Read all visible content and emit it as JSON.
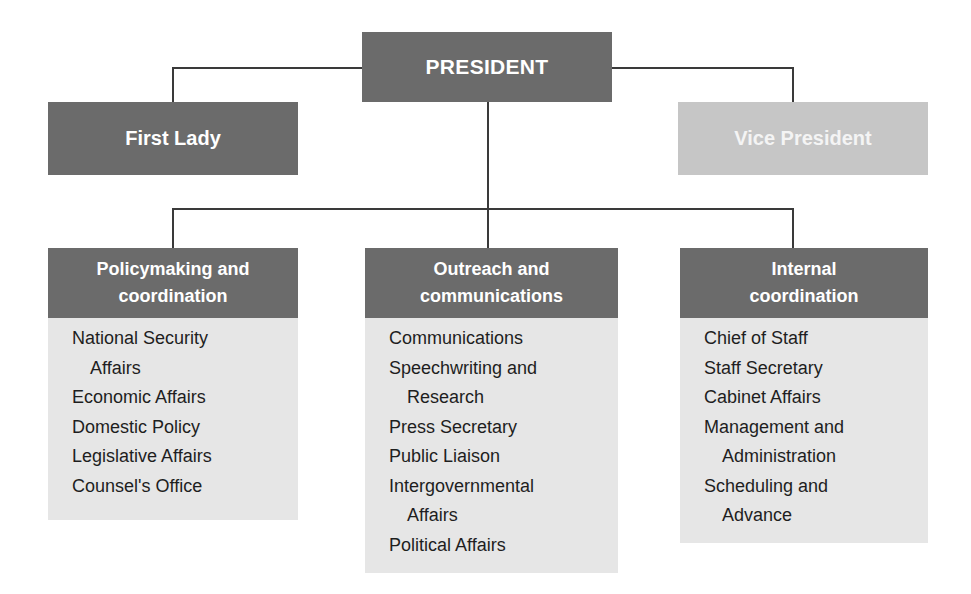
{
  "top": {
    "president": "PRESIDENT",
    "first_lady": "First Lady",
    "vice_president": "Vice President"
  },
  "units": [
    {
      "title_line1": "Policymaking and",
      "title_line2": "coordination",
      "items": [
        {
          "line1": "National Security",
          "line2": "Affairs"
        },
        {
          "line1": "Economic Affairs"
        },
        {
          "line1": "Domestic Policy"
        },
        {
          "line1": "Legislative Affairs"
        },
        {
          "line1": "Counsel's Office"
        }
      ]
    },
    {
      "title_line1": "Outreach and",
      "title_line2": "communications",
      "items": [
        {
          "line1": "Communications"
        },
        {
          "line1": "Speechwriting and",
          "line2": "Research"
        },
        {
          "line1": "Press Secretary"
        },
        {
          "line1": "Public Liaison"
        },
        {
          "line1": "Intergovernmental",
          "line2": "Affairs"
        },
        {
          "line1": "Political Affairs"
        }
      ]
    },
    {
      "title_line1": "Internal",
      "title_line2": "coordination",
      "items": [
        {
          "line1": "Chief of Staff"
        },
        {
          "line1": "Staff Secretary"
        },
        {
          "line1": "Cabinet Affairs"
        },
        {
          "line1": "Management and",
          "line2": "Administration"
        },
        {
          "line1": "Scheduling and",
          "line2": "Advance"
        }
      ]
    }
  ],
  "colors": {
    "dark_box": "#6b6b6b",
    "light_box": "#c6c6c6",
    "body_box": "#e6e6e6",
    "connector": "#3a3a3a"
  }
}
